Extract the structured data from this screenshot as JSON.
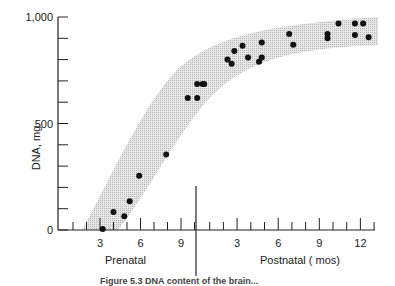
{
  "chart_data": {
    "type": "scatter",
    "title": "",
    "ylabel": "DNA, mg",
    "xlabel_prenatal": "Prenatal",
    "xlabel_postnatal": "Postnatal  ( mos)",
    "ylim": [
      0,
      1000
    ],
    "y_ticks": [
      {
        "v": 0,
        "label": "0"
      },
      {
        "v": 500,
        "label": "500"
      },
      {
        "v": 1000,
        "label": "1,000"
      }
    ],
    "y_minor_step": 100,
    "x_prenatal_ticks": [
      {
        "m": 3,
        "label": "3"
      },
      {
        "m": 6,
        "label": "6"
      },
      {
        "m": 9,
        "label": "9"
      }
    ],
    "x_postnatal_ticks": [
      {
        "m": 3,
        "label": "3"
      },
      {
        "m": 6,
        "label": "6"
      },
      {
        "m": 9,
        "label": "9"
      },
      {
        "m": 12,
        "label": "12"
      }
    ],
    "birth_divider": "between prenatal month 10 and postnatal month 0",
    "band": "shaded sigmoid envelope around data",
    "series": [
      {
        "name": "Prenatal",
        "points": [
          {
            "x": 3.2,
            "y": 5
          },
          {
            "x": 4.0,
            "y": 85
          },
          {
            "x": 4.8,
            "y": 65
          },
          {
            "x": 5.2,
            "y": 135
          },
          {
            "x": 5.9,
            "y": 255
          },
          {
            "x": 7.9,
            "y": 355
          },
          {
            "x": 9.5,
            "y": 620
          },
          {
            "x": 10.2,
            "y": 620
          },
          {
            "x": 10.2,
            "y": 685
          },
          {
            "x": 10.6,
            "y": 685
          }
        ]
      },
      {
        "name": "Postnatal",
        "points": [
          {
            "x": 0.6,
            "y": 685
          },
          {
            "x": 2.3,
            "y": 800
          },
          {
            "x": 2.6,
            "y": 780
          },
          {
            "x": 2.8,
            "y": 840
          },
          {
            "x": 3.4,
            "y": 865
          },
          {
            "x": 3.8,
            "y": 810
          },
          {
            "x": 4.6,
            "y": 790
          },
          {
            "x": 4.8,
            "y": 810
          },
          {
            "x": 4.8,
            "y": 880
          },
          {
            "x": 6.8,
            "y": 920
          },
          {
            "x": 7.1,
            "y": 870
          },
          {
            "x": 9.6,
            "y": 900
          },
          {
            "x": 9.6,
            "y": 920
          },
          {
            "x": 10.4,
            "y": 970
          },
          {
            "x": 11.6,
            "y": 970
          },
          {
            "x": 11.6,
            "y": 915
          },
          {
            "x": 12.2,
            "y": 970
          },
          {
            "x": 12.6,
            "y": 905
          }
        ]
      }
    ]
  },
  "caption": "Figure 5.3  DNA content of the brain..."
}
